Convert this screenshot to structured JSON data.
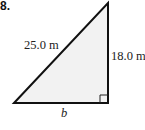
{
  "problem_number": "8.",
  "triangle": {
    "type": "right-triangle",
    "fill_color": "#f2f2f2",
    "stroke_color": "#111111",
    "labels": {
      "hypotenuse": "25.0 m",
      "vertical_leg": "18.0 m",
      "base": "b"
    },
    "right_angle_marker": "bottom-right"
  }
}
